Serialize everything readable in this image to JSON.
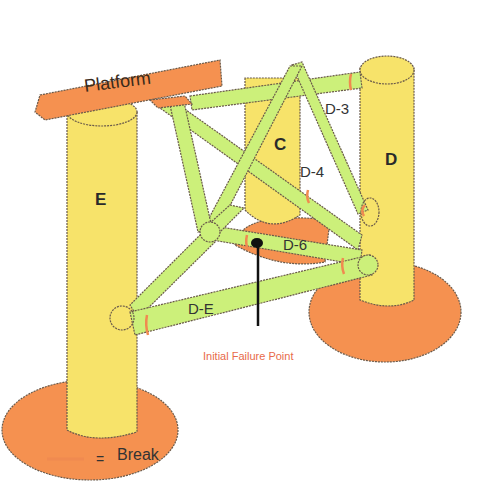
{
  "diagram": {
    "platform_label": "Platform",
    "columns": [
      {
        "id": "E",
        "label": "E"
      },
      {
        "id": "C",
        "label": "C"
      },
      {
        "id": "D",
        "label": "D"
      }
    ],
    "braces": [
      {
        "id": "D-3",
        "label": "D-3"
      },
      {
        "id": "D-4",
        "label": "D-4"
      },
      {
        "id": "D-6",
        "label": "D-6"
      },
      {
        "id": "D-E",
        "label": "D-E"
      }
    ],
    "annotation": "Initial Failure Point",
    "legend": {
      "equals": "=",
      "label": "Break",
      "color": "#f08a50"
    },
    "colors": {
      "column": "#f7e36a",
      "brace": "#ccf07a",
      "pontoon": "#f59150",
      "outline": "#6a5a4a"
    }
  }
}
